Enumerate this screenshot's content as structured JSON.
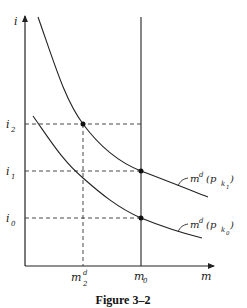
{
  "figure": {
    "caption": "Figure 3–2",
    "axes": {
      "y_label": "i",
      "x_label": "m"
    },
    "y_ticks": [
      {
        "id": "i2",
        "base": "i",
        "sub": "2"
      },
      {
        "id": "i1",
        "base": "i",
        "sub": "1"
      },
      {
        "id": "i0",
        "base": "i",
        "sub": "0"
      }
    ],
    "x_ticks": [
      {
        "id": "m2d",
        "base": "m",
        "sup": "d",
        "sub": "2"
      },
      {
        "id": "m0",
        "base": "m",
        "sub": "0"
      }
    ],
    "curves": [
      {
        "id": "upper",
        "label_base": "m",
        "label_sup": "d",
        "label_arg": "(p",
        "label_sub": "k",
        "label_subsub": "1",
        "label_close": ")"
      },
      {
        "id": "lower",
        "label_base": "m",
        "label_sup": "d",
        "label_arg": "(p",
        "label_sub": "k",
        "label_subsub": "0",
        "label_close": ")"
      }
    ],
    "points": [
      {
        "id": "upper-at-i2",
        "curve": "upper",
        "level": "i2",
        "m": "m2d"
      },
      {
        "id": "upper-at-i1",
        "curve": "upper",
        "level": "i1",
        "m": "m0"
      },
      {
        "id": "lower-at-i0",
        "curve": "lower",
        "level": "i0",
        "m": "m0"
      }
    ]
  }
}
